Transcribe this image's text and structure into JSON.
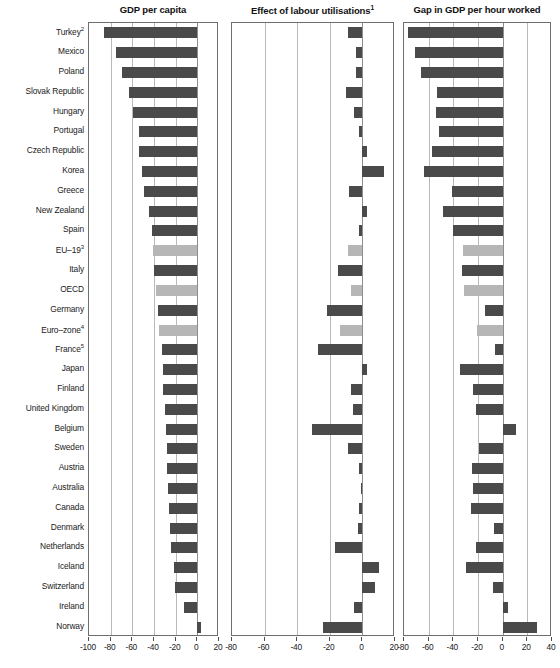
{
  "chart_data": {
    "type": "bar",
    "title": "",
    "orientation": "horizontal",
    "grid": true,
    "legend": null,
    "categories": [
      "Turkey²",
      "Mexico",
      "Poland",
      "Slovak Republic",
      "Hungary",
      "Portugal",
      "Czech Republic",
      "Korea",
      "Greece",
      "New Zealand",
      "Spain",
      "EU–19³",
      "Italy",
      "OECD",
      "Germany",
      "Euro–zone⁴",
      "France⁵",
      "Japan",
      "Finland",
      "United Kingdom",
      "Belgium",
      "Sweden",
      "Austria",
      "Australia",
      "Canada",
      "Denmark",
      "Netherlands",
      "Iceland",
      "Switzerland",
      "Ireland",
      "Norway"
    ],
    "highlighted_categories": [
      "EU–19³",
      "OECD",
      "Euro–zone⁴"
    ],
    "panels": [
      {
        "title": "GDP per capita",
        "title_note": "",
        "xlabel": "",
        "ylabel": "",
        "xlim": [
          -100,
          20
        ],
        "xticks": [
          -100,
          -80,
          -60,
          -40,
          -20,
          0,
          20
        ],
        "xticklabels": [
          "-100",
          "-80",
          "-60",
          "-40",
          "-20",
          "0",
          "20"
        ],
        "values": [
          -86,
          -75,
          -70,
          -63,
          -59,
          -54,
          -54,
          -51,
          -49,
          -45,
          -42,
          -41,
          -40,
          -38,
          -36,
          -35,
          -33,
          -32,
          -32,
          -30,
          -29,
          -28,
          -28,
          -27,
          -26,
          -25,
          -24,
          -22,
          -21,
          -12,
          3
        ]
      },
      {
        "title": "Effect of labour utilisations",
        "title_note": "1",
        "xlabel": "",
        "ylabel": "",
        "xlim": [
          -80,
          20
        ],
        "xticks": [
          -80,
          -60,
          -40,
          -20,
          0,
          20
        ],
        "xticklabels": [
          "-80",
          "-60",
          "-40",
          "-20",
          "0",
          "20"
        ],
        "values": [
          -9,
          -4,
          -4,
          -10,
          -5,
          -2,
          3,
          13,
          -8,
          3,
          -2,
          -9,
          -15,
          -7,
          -22,
          -14,
          -27,
          3,
          -7,
          -6,
          -31,
          -9,
          -2,
          -1,
          -2,
          -3,
          -17,
          10,
          8,
          -5,
          -24
        ]
      },
      {
        "title": "Gap in GDP per hour worked",
        "title_note": "",
        "xlabel": "",
        "ylabel": "",
        "xlim": [
          -80,
          40
        ],
        "xticks": [
          -80,
          -60,
          -40,
          -20,
          0,
          20,
          40
        ],
        "xticklabels": [
          "-80",
          "-60",
          "-40",
          "-20",
          "0",
          "20",
          "40"
        ],
        "values": [
          -77,
          -71,
          -66,
          -53,
          -54,
          -52,
          -57,
          -64,
          -41,
          -48,
          -40,
          -32,
          -33,
          -31,
          -14,
          -21,
          -6,
          -1,
          -35,
          -24,
          2,
          11,
          -19,
          -25,
          -24,
          -26,
          -7,
          -22,
          6,
          -30,
          -8,
          4,
          28
        ]
      }
    ]
  },
  "panel_values": {
    "p1": [
      -86,
      -75,
      -70,
      -63,
      -59,
      -54,
      -54,
      -51,
      -49,
      -45,
      -42,
      -41,
      -40,
      -38,
      -36,
      -35,
      -33,
      -32,
      -32,
      -30,
      -29,
      -28,
      -28,
      -27,
      -26,
      -25,
      -24,
      -22,
      -21,
      -12,
      3
    ],
    "p2": [
      -9,
      -4,
      -4,
      -10,
      -5,
      -2,
      3,
      13,
      -8,
      3,
      -2,
      -9,
      -15,
      -7,
      -22,
      -14,
      -27,
      3,
      -7,
      -6,
      -31,
      -9,
      -2,
      -1,
      -2,
      -3,
      -17,
      10,
      8,
      -5,
      -24
    ],
    "p3": [
      -77,
      -71,
      -66,
      -53,
      -54,
      -52,
      -57,
      -64,
      -41,
      -48,
      -40,
      -32,
      -33,
      -31,
      -14,
      -21,
      -6,
      -35,
      -24,
      -22,
      11,
      -19,
      -25,
      -24,
      -26,
      -7,
      -22,
      -30,
      -8,
      4,
      28
    ]
  },
  "axis_titles": {
    "panel1": "GDP per capita",
    "panel2": "Effect of labour utilisations",
    "panel2_sup": "1",
    "panel3": "Gap in GDP per hour worked"
  }
}
